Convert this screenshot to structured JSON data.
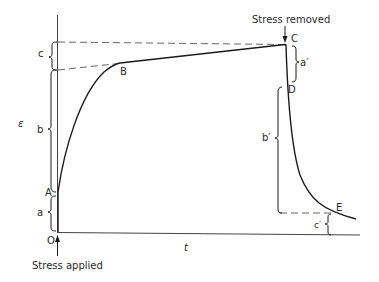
{
  "diagram": {
    "type": "creep-recovery curve",
    "y_axis_label": "ε",
    "x_axis_label": "t",
    "origin_label": "O",
    "points": {
      "A": "A",
      "B": "B",
      "C": "C",
      "D": "D",
      "E": "E"
    },
    "segments": {
      "a": "a",
      "b": "b",
      "c": "c",
      "a_prime": "a′",
      "b_prime": "b′",
      "c_prime": "c′"
    },
    "annotations": {
      "stress_applied": "Stress applied",
      "stress_removed": "Stress removed"
    },
    "colors": {
      "line": "#1a1a1a",
      "dashed": "#555555",
      "text": "#2a2a2a",
      "background": "#ffffff"
    }
  }
}
